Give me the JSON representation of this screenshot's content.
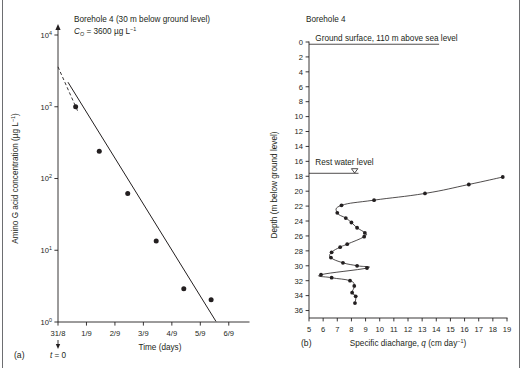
{
  "figure": {
    "background_color": "#ffffff",
    "ink_color": "#231f20",
    "border_color": "#6d6e71"
  },
  "panel_a": {
    "label": "(a)",
    "title_line1": "Borehole 4 (30 m below ground level)",
    "title_line2_prefix": "C",
    "title_line2_sub": "O",
    "title_line2_value": " = 3600 µg L",
    "title_line2_sup": "−1",
    "origin_annotation": "t = 0",
    "origin_annotation_italic": "t",
    "y_axis_label": "Amino G acid concentration (µg L",
    "y_axis_label_sup": "−1",
    "y_axis_label_close": ")",
    "x_axis_label": "Time (days)",
    "chart_data": {
      "type": "scatter",
      "title": "Borehole 4 (30 m below ground level)",
      "subtitle": "C_O = 3600 µg L^-1",
      "xlabel": "Time (days)",
      "ylabel": "Amino G acid concentration (µg L^-1)",
      "yscale": "log",
      "ylim": [
        1,
        10000
      ],
      "ytick_labels": [
        "10⁰",
        "10¹",
        "10²",
        "10³",
        "10⁴"
      ],
      "ytick_values": [
        1,
        10,
        100,
        1000,
        10000
      ],
      "xlim": [
        0,
        6.5
      ],
      "xtick_labels": [
        "31/8",
        "1/9",
        "2/9",
        "3/9",
        "4/9",
        "5/9",
        "6/9"
      ],
      "xtick_values": [
        0,
        1,
        2,
        3,
        4,
        5,
        6
      ],
      "grid": false,
      "legend": null,
      "x": [
        0.62,
        1.45,
        2.45,
        3.45,
        4.42,
        5.38
      ],
      "y": [
        1000,
        240,
        62,
        13.5,
        2.9,
        2.05
      ],
      "fit_line": {
        "label": "first-order decay fit",
        "x": [
          0.35,
          5.55
        ],
        "y": [
          2200,
          1.02
        ],
        "style": "solid"
      },
      "extrapolation": {
        "label": "extrapolation to C_O",
        "x": [
          0.0,
          0.72
        ],
        "y": [
          3600,
          820
        ],
        "style": "dashed"
      },
      "annotations": [
        {
          "text": "t = 0",
          "x": 0,
          "y": 1,
          "position": "below-axis"
        }
      ]
    }
  },
  "panel_b": {
    "label": "(b)",
    "title": "Borehole 4",
    "ground_surface_label": "Ground surface, 110 m above sea level",
    "rest_water_level_label": "Rest water level",
    "water_table_symbol": "▽",
    "y_axis_label": "Depth (m below ground level)",
    "x_axis_label_prefix": "Specific diacharge, ",
    "x_axis_label_italic": "q",
    "x_axis_label_units": " (cm day",
    "x_axis_label_sup": "−1",
    "x_axis_label_close": ")",
    "chart_data": {
      "type": "line",
      "title": "Borehole 4",
      "xlabel": "Specific diacharge, q (cm day^-1)",
      "ylabel": "Depth (m below ground level)",
      "y_inverted": true,
      "ylim": [
        0,
        37
      ],
      "ytick_values": [
        0,
        2,
        4,
        6,
        8,
        10,
        12,
        14,
        16,
        18,
        20,
        22,
        24,
        26,
        28,
        30,
        32,
        34,
        36
      ],
      "ytick_labels": [
        "0",
        "2",
        "4",
        "6",
        "8",
        "10",
        "12",
        "14",
        "16",
        "18",
        "20",
        "22",
        "24",
        "26",
        "28",
        "30",
        "32",
        "34",
        "36"
      ],
      "xlim": [
        5,
        19
      ],
      "xtick_values": [
        5,
        6,
        7,
        8,
        9,
        10,
        11,
        12,
        13,
        14,
        15,
        16,
        17,
        18,
        19
      ],
      "xtick_labels": [
        "5",
        "6",
        "7",
        "8",
        "9",
        "10",
        "11",
        "12",
        "13",
        "14",
        "15",
        "16",
        "17",
        "18",
        "19"
      ],
      "grid": false,
      "legend": null,
      "series": [
        {
          "name": "Specific discharge profile",
          "q": [
            18.7,
            16.3,
            13.2,
            9.6,
            7.3,
            7.0,
            7.6,
            8.0,
            8.4,
            8.95,
            8.9,
            7.7,
            7.2,
            6.6,
            6.55,
            7.4,
            8.4,
            9.1,
            5.85,
            6.6,
            7.9,
            8.2,
            8.05,
            8.3,
            8.25
          ],
          "depth": [
            18.1,
            19.1,
            20.3,
            21.2,
            21.9,
            22.9,
            23.6,
            24.2,
            24.9,
            25.6,
            26.1,
            27.1,
            27.5,
            28.2,
            28.9,
            29.6,
            30.0,
            30.3,
            31.2,
            31.6,
            32.0,
            32.7,
            33.6,
            34.1,
            35.0
          ]
        }
      ],
      "reference_lines": [
        {
          "label": "Ground surface, 110 m above sea level",
          "depth": 0.3
        },
        {
          "label": "Rest water level",
          "depth": 17.6,
          "symbol": "water-table"
        }
      ]
    }
  }
}
